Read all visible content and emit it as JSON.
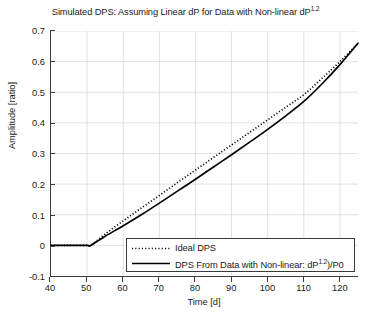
{
  "chart_data": {
    "type": "line",
    "title": "Simulated DPS: Assuming Linear dP for Data with Non-linear dP",
    "title_exponent": "1.2",
    "xlabel": "Time [d]",
    "ylabel": "Amplitude [ratio]",
    "xlim": [
      40,
      125
    ],
    "ylim": [
      -0.1,
      0.7
    ],
    "xticks": [
      40,
      50,
      60,
      70,
      80,
      90,
      100,
      110,
      120
    ],
    "yticks": [
      -0.1,
      0,
      0.1,
      0.2,
      0.3,
      0.4,
      0.5,
      0.6,
      0.7
    ],
    "grid": true,
    "legend_position": "lower right",
    "x": [
      40,
      45,
      50,
      51,
      55,
      60,
      65,
      70,
      75,
      80,
      85,
      90,
      95,
      100,
      105,
      110,
      115,
      120,
      125
    ],
    "series": [
      {
        "name": "Ideal DPS",
        "style": "dotted",
        "color": "#000000",
        "values": [
          0,
          0,
          0,
          0,
          0.037,
          0.08,
          0.122,
          0.163,
          0.205,
          0.246,
          0.287,
          0.328,
          0.369,
          0.41,
          0.451,
          0.492,
          0.545,
          0.6,
          0.66
        ]
      },
      {
        "name": "DPS From Data with Non-linear: dP",
        "name_exponent": "1.2",
        "name_suffix": ")/P0",
        "style": "solid",
        "color": "#000000",
        "values": [
          0,
          0,
          0,
          0,
          0.03,
          0.064,
          0.1,
          0.138,
          0.177,
          0.216,
          0.256,
          0.296,
          0.337,
          0.379,
          0.423,
          0.47,
          0.527,
          0.59,
          0.66
        ]
      }
    ]
  },
  "legend": {
    "items": [
      {
        "label": "Ideal DPS",
        "exponent": "",
        "suffix": ""
      },
      {
        "label": "DPS From Data with Non-linear: dP",
        "exponent": "1.2",
        "suffix": ")/P0"
      }
    ]
  },
  "colors": {
    "axis": "#3a3a3a",
    "grid": "#d9d9d9",
    "series": "#000000",
    "background": "#ffffff"
  }
}
